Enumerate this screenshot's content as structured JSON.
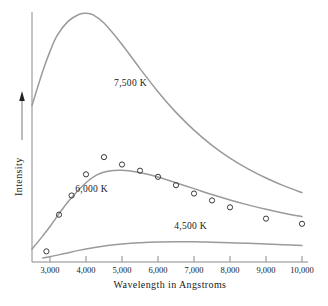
{
  "chart_data": {
    "type": "line",
    "title": "",
    "xlabel": "Wavelength in Angstroms",
    "ylabel": "Intensity",
    "xlim": [
      2500,
      10000
    ],
    "ylim": [
      0,
      1.0
    ],
    "grid": false,
    "legend": "inline-curve-labels",
    "xtick_labels": [
      "3,000",
      "4,000",
      "5,000",
      "6,000",
      "7,000",
      "8,000",
      "9,000",
      "10,000"
    ],
    "xticks": [
      3000,
      4000,
      5000,
      6000,
      7000,
      8000,
      9000,
      10000
    ],
    "ytick_labels": [],
    "y_axis_arrow": "up",
    "series": [
      {
        "name": "7,500 K",
        "label": "7,500  K",
        "color": "#9a9a9a",
        "x": [
          2500,
          2800,
          3000,
          3200,
          3500,
          3800,
          4000,
          4200,
          4500,
          5000,
          5500,
          6000,
          6500,
          7000,
          7500,
          8000,
          8500,
          9000,
          9500,
          10000
        ],
        "y": [
          0.62,
          0.76,
          0.84,
          0.905,
          0.962,
          0.99,
          0.995,
          0.988,
          0.955,
          0.868,
          0.77,
          0.676,
          0.592,
          0.52,
          0.458,
          0.406,
          0.362,
          0.325,
          0.293,
          0.266
        ]
      },
      {
        "name": "6,000 K",
        "label": "6,000  K",
        "color": "#9a9a9a",
        "x": [
          2500,
          2800,
          3000,
          3300,
          3600,
          4000,
          4300,
          4600,
          5000,
          5400,
          5800,
          6200,
          6600,
          7000,
          7500,
          8000,
          8500,
          9000,
          9500,
          10000
        ],
        "y": [
          0.036,
          0.09,
          0.128,
          0.19,
          0.246,
          0.306,
          0.338,
          0.353,
          0.357,
          0.35,
          0.337,
          0.32,
          0.301,
          0.282,
          0.258,
          0.236,
          0.216,
          0.198,
          0.182,
          0.168
        ]
      },
      {
        "name": "4,500 K",
        "label": "4,500  K",
        "color": "#9a9a9a",
        "x": [
          2800,
          3000,
          3400,
          3800,
          4200,
          4600,
          5000,
          5500,
          6000,
          6500,
          7000,
          7500,
          8000,
          8500,
          9000,
          9500,
          10000
        ],
        "y": [
          0.0,
          0.005,
          0.018,
          0.031,
          0.042,
          0.051,
          0.057,
          0.062,
          0.065,
          0.066,
          0.066,
          0.064,
          0.062,
          0.06,
          0.057,
          0.054,
          0.051
        ]
      }
    ],
    "observed_points": {
      "series_name": "6,000 K",
      "marker": "open-circle",
      "x": [
        2900,
        3250,
        3600,
        4000,
        4500,
        5000,
        5500,
        6000,
        6500,
        7000,
        7500,
        8000,
        9000,
        10000
      ],
      "y": [
        0.027,
        0.176,
        0.254,
        0.34,
        0.41,
        0.38,
        0.355,
        0.33,
        0.296,
        0.262,
        0.234,
        0.206,
        0.16,
        0.139
      ]
    },
    "curve_label_positions": [
      {
        "name": "7,500 K",
        "x": 4780,
        "y": 0.7
      },
      {
        "name": "6,000 K",
        "x": 3700,
        "y": 0.27
      },
      {
        "name": "4,500 K",
        "x": 6450,
        "y": 0.118
      }
    ],
    "colors": {
      "curve": "#9a9a9a",
      "axis": "#8a8a8a",
      "marker_stroke": "#3a3a3a",
      "text": "#202020",
      "background": "#ffffff"
    }
  }
}
